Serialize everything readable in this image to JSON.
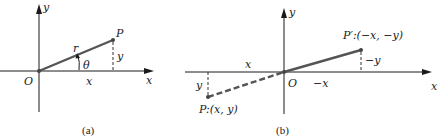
{
  "panel_a": {
    "caption": "(a)",
    "axis_x_label": "x",
    "axis_y_label": "y",
    "origin_label": "O",
    "point_label": "P",
    "radius_label": "r",
    "angle_label": "θ",
    "x_component_label": "x",
    "y_component_label": "y"
  },
  "panel_b": {
    "caption": "(b)",
    "axis_x_label": "x",
    "axis_y_label": "y",
    "origin_label": "O",
    "point_p_label": "P:(x, y)",
    "point_p_prime_label": "P′:(−x, −y)",
    "x_component_label": "x",
    "y_component_label": "y",
    "neg_x_component_label": "−x",
    "neg_y_component_label": "−y"
  },
  "colors": {
    "axis": "#1a1a1a",
    "vector": "#555555",
    "background": "#ffffff"
  }
}
